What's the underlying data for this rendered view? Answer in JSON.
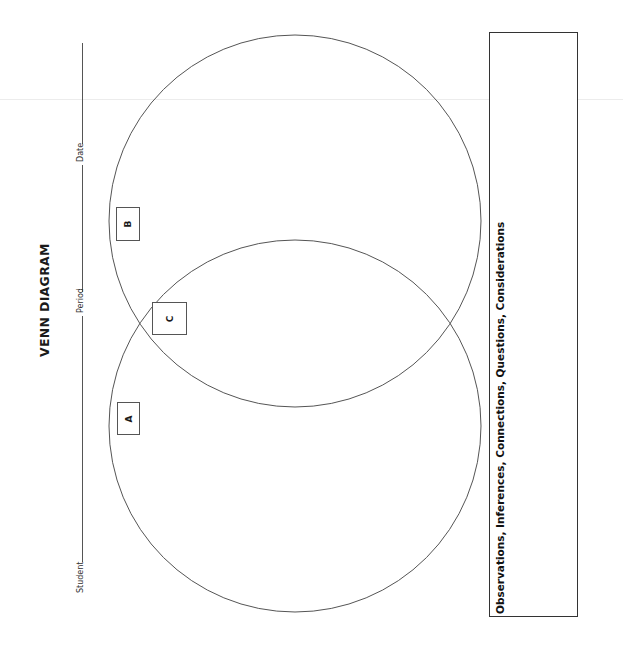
{
  "worksheet": {
    "title": "VENN DIAGRAM",
    "fields": {
      "student_label": "Student",
      "student_value": "",
      "period_label": "Period",
      "period_value": "",
      "date_label": "Date",
      "date_value": ""
    },
    "regions": [
      {
        "id": "A",
        "label": "A",
        "description": "left circle only"
      },
      {
        "id": "C",
        "label": "C",
        "description": "overlap of both circles"
      },
      {
        "id": "B",
        "label": "B",
        "description": "right circle only"
      }
    ],
    "notes": {
      "label": "Observations, Inferences, Connections, Questions, Considerations",
      "value": ""
    },
    "orientation": "rotated 90 degrees counter-clockwise",
    "colors": {
      "outline": "#555555",
      "text": "#1a1a1a",
      "background": "#ffffff"
    }
  }
}
